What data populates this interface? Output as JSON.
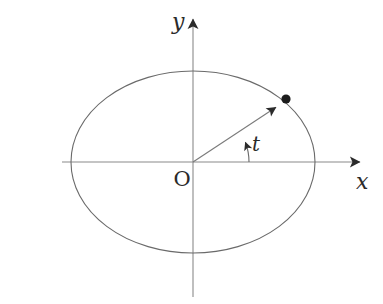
{
  "figure": {
    "kind": "math-diagram",
    "description_type": "parametric-ellipse-with-angle",
    "background_color": "#ffffff",
    "width": 383,
    "height": 304,
    "labels": {
      "y_axis": "y",
      "x_axis": "x",
      "origin": "O",
      "angle": "t"
    },
    "colors": {
      "curve": "#6a6a6a",
      "axis": "#8a8a8a",
      "radius": "#7a7a7a",
      "marker": "#1c1c1c",
      "text": "#2a2a2a"
    }
  },
  "chart_data": {
    "type": "scatter",
    "title": "",
    "xlabel": "x",
    "ylabel": "y",
    "grid": false,
    "legend": "none",
    "origin_label": "O",
    "annotations": [
      {
        "name": "angle-label",
        "text": "t",
        "x": 256,
        "y": 144
      },
      {
        "name": "origin-label",
        "text": "O",
        "x": 182,
        "y": 179
      },
      {
        "name": "x-axis-label",
        "text": "x",
        "x": 362,
        "y": 182
      },
      {
        "name": "y-axis-label",
        "text": "y",
        "x": 178,
        "y": 22
      }
    ],
    "ellipse": {
      "center_px": [
        193,
        162
      ],
      "semi_axis_x_px": 122,
      "semi_axis_y_px": 91,
      "stroke": "#6a6a6a",
      "stroke_width": 1.1
    },
    "axes": {
      "x_axis_px": {
        "y": 162,
        "x_start": 62,
        "x_end": 367,
        "arrow": "end"
      },
      "y_axis_px": {
        "x": 193,
        "y_start": 297,
        "y_end": 12,
        "arrow": "end"
      }
    },
    "radius_vector": {
      "from_px": [
        193,
        162
      ],
      "to_px": [
        281,
        104
      ],
      "arrow": "end",
      "stroke": "#7a7a7a"
    },
    "point_marker": {
      "label": "",
      "position_px": [
        286,
        99
      ],
      "radius_px": 4.6,
      "fill": "#1c1c1c"
    },
    "angle_arc": {
      "from_px": [
        249,
        162
      ],
      "to_px": [
        243,
        140
      ],
      "radius_px": 56,
      "arrow": "end",
      "stroke": "#6a6a6a"
    }
  }
}
